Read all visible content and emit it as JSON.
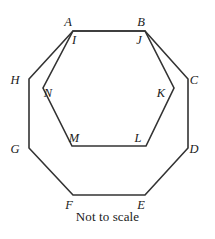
{
  "figure": {
    "caption": "Not to scale",
    "stroke_color": "#333333",
    "background_color": "#ffffff",
    "outer_shape": {
      "name": "octagon",
      "vertex_order": "A B C D E F G H",
      "labels": [
        "A",
        "B",
        "C",
        "D",
        "E",
        "F",
        "G",
        "H"
      ],
      "points": "73,31 145,31 188,79 188,148 145,195 73,195 29,148 29,79"
    },
    "inner_shape": {
      "name": "hexagon",
      "vertex_order": "I J K L M N",
      "labels": [
        "I",
        "J",
        "K",
        "L",
        "M",
        "N"
      ],
      "points": "73,31 145,31 174,88 146,146 72,146 43,88"
    },
    "vertex_labels": [
      {
        "id": "A",
        "text": "A",
        "x": 68,
        "y": 26
      },
      {
        "id": "B",
        "text": "B",
        "x": 141,
        "y": 26
      },
      {
        "id": "C",
        "text": "C",
        "x": 194,
        "y": 84
      },
      {
        "id": "D",
        "text": "D",
        "x": 194,
        "y": 153
      },
      {
        "id": "E",
        "text": "E",
        "x": 141,
        "y": 209
      },
      {
        "id": "F",
        "text": "F",
        "x": 69,
        "y": 209
      },
      {
        "id": "G",
        "text": "G",
        "x": 15,
        "y": 153
      },
      {
        "id": "H",
        "text": "H",
        "x": 15,
        "y": 84
      },
      {
        "id": "I",
        "text": "I",
        "x": 74,
        "y": 44
      },
      {
        "id": "J",
        "text": "J",
        "x": 139,
        "y": 44
      },
      {
        "id": "K",
        "text": "K",
        "x": 161,
        "y": 97
      },
      {
        "id": "L",
        "text": "L",
        "x": 138,
        "y": 142
      },
      {
        "id": "M",
        "text": "M",
        "x": 74,
        "y": 142
      },
      {
        "id": "N",
        "text": "N",
        "x": 48,
        "y": 97
      }
    ]
  }
}
